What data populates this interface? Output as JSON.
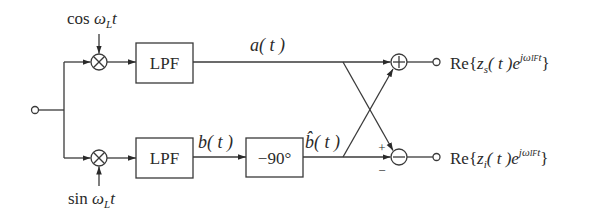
{
  "diagram": {
    "type": "block-diagram",
    "colors": {
      "line": "#3a3a3a",
      "background": "#ffffff",
      "text": "#2a2a2a"
    },
    "input": {
      "terminal": "input-node"
    },
    "lo_signals": {
      "top": {
        "func": "cos",
        "omega": "ω",
        "sub": "L",
        "var": "t"
      },
      "bottom": {
        "func": "sin",
        "omega": "ω",
        "sub": "L",
        "var": "t"
      }
    },
    "mixers": [
      {
        "id": "mixer-top",
        "symbol": "⊗"
      },
      {
        "id": "mixer-bottom",
        "symbol": "⊗"
      }
    ],
    "blocks": {
      "lpf_top": "LPF",
      "lpf_bottom": "LPF",
      "phase_shift": "−90°"
    },
    "signals": {
      "a": {
        "name": "a",
        "arg": "( t )"
      },
      "b": {
        "name": "b",
        "arg": "( t )"
      },
      "b_hat": {
        "name": "b̂",
        "arg": "( t )"
      }
    },
    "summers": {
      "top": {
        "symbol": "+"
      },
      "bottom": {
        "symbol": "−",
        "sign_plus": "+",
        "sign_minus": "−"
      }
    },
    "outputs": {
      "top": {
        "re": "Re",
        "open": "{",
        "z": "z",
        "z_sub": "s",
        "arg": "( t )",
        "e": "e",
        "exp": "jω",
        "exp_sub": "IF",
        "exp_var": "t",
        "close": "}"
      },
      "bottom": {
        "re": "Re",
        "open": "{",
        "z": "z",
        "z_sub": "i",
        "arg": "( t )",
        "e": "e",
        "exp": "jω",
        "exp_sub": "IF",
        "exp_var": "t",
        "close": "}"
      }
    }
  }
}
